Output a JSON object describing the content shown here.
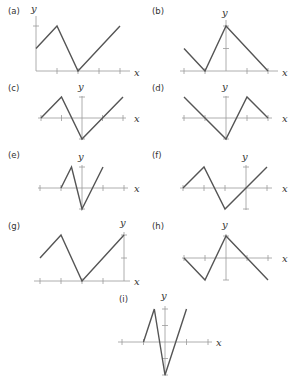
{
  "chart_data": [
    {
      "type": "line",
      "label": "(a)",
      "xlabel": "x",
      "ylabel": "y",
      "xlim": [
        0,
        4
      ],
      "ylim": [
        0,
        2
      ],
      "points": [
        [
          0,
          1
        ],
        [
          1,
          2
        ],
        [
          2,
          0
        ],
        [
          4,
          2
        ]
      ],
      "xticks": [
        1,
        2,
        3,
        4
      ],
      "yticks": [
        2
      ]
    },
    {
      "type": "line",
      "label": "(b)",
      "xlabel": "x",
      "ylabel": "y",
      "xlim": [
        -2,
        2
      ],
      "ylim": [
        0,
        2
      ],
      "points": [
        [
          -2,
          1
        ],
        [
          -1,
          0
        ],
        [
          0,
          2
        ],
        [
          2,
          0
        ]
      ],
      "xticks": [
        -2,
        -1,
        1,
        2
      ],
      "yticks": [
        1,
        2
      ]
    },
    {
      "type": "line",
      "label": "(c)",
      "xlabel": "x",
      "ylabel": "y",
      "xlim": [
        -2,
        2
      ],
      "ylim": [
        -1,
        1
      ],
      "points": [
        [
          -2,
          0
        ],
        [
          -1,
          1
        ],
        [
          0,
          -1
        ],
        [
          2,
          1
        ]
      ],
      "xticks": [
        -2,
        -1,
        1,
        2
      ],
      "yticks": [
        1,
        -1
      ]
    },
    {
      "type": "line",
      "label": "(d)",
      "xlabel": "x",
      "ylabel": "y",
      "xlim": [
        -2,
        2
      ],
      "ylim": [
        -1,
        1
      ],
      "points": [
        [
          -2,
          1
        ],
        [
          0,
          -1
        ],
        [
          1,
          1
        ],
        [
          2,
          0
        ]
      ],
      "xticks": [
        -2,
        -1,
        1,
        2
      ],
      "yticks": [
        1,
        -1
      ]
    },
    {
      "type": "line",
      "label": "(e)",
      "xlabel": "x",
      "ylabel": "y",
      "xlim": [
        -2,
        2
      ],
      "ylim": [
        -1,
        1
      ],
      "points": [
        [
          -1,
          0
        ],
        [
          -0.5,
          1
        ],
        [
          0,
          -1
        ],
        [
          1,
          1
        ]
      ],
      "xticks": [
        -2,
        -1,
        1,
        2
      ],
      "yticks": [
        1,
        -1
      ]
    },
    {
      "type": "line",
      "label": "(f)",
      "xlabel": "x",
      "ylabel": "y",
      "xlim": [
        -3,
        1
      ],
      "ylim": [
        -1,
        1
      ],
      "points": [
        [
          -3,
          0
        ],
        [
          -2,
          1
        ],
        [
          -1,
          -1
        ],
        [
          1,
          1
        ]
      ],
      "xticks": [
        -3,
        -2,
        -1,
        1
      ],
      "yticks": [
        1,
        -1
      ]
    },
    {
      "type": "line",
      "label": "(g)",
      "xlabel": "x",
      "ylabel": "y",
      "xlim": [
        -4,
        0
      ],
      "ylim": [
        0,
        2
      ],
      "points": [
        [
          -4,
          1
        ],
        [
          -3,
          2
        ],
        [
          -2,
          0
        ],
        [
          0,
          2
        ]
      ],
      "xticks": [
        -4,
        -3,
        -2,
        -1
      ],
      "yticks": [
        1,
        2
      ]
    },
    {
      "type": "line",
      "label": "(h)",
      "xlabel": "x",
      "ylabel": "y",
      "xlim": [
        -2,
        2
      ],
      "ylim": [
        -1,
        1
      ],
      "points": [
        [
          -2,
          0
        ],
        [
          -1,
          -1
        ],
        [
          0,
          1
        ],
        [
          2,
          -1
        ]
      ],
      "xticks": [
        -2,
        -1,
        1,
        2
      ],
      "yticks": [
        1,
        -1
      ]
    },
    {
      "type": "line",
      "label": "(i)",
      "xlabel": "x",
      "ylabel": "y",
      "xlim": [
        -2,
        2
      ],
      "ylim": [
        -2,
        2
      ],
      "points": [
        [
          -1,
          0
        ],
        [
          -0.5,
          2
        ],
        [
          0,
          -2
        ],
        [
          1,
          2
        ]
      ],
      "xticks": [
        -2,
        -1,
        1,
        2
      ],
      "yticks": [
        2,
        1,
        -1,
        -2
      ]
    }
  ]
}
